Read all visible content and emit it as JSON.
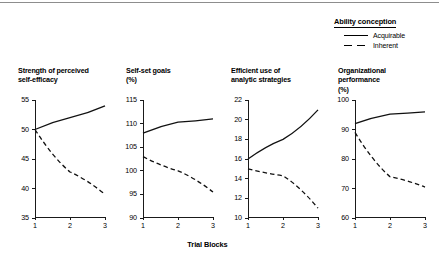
{
  "figure": {
    "xaxis_title": "Trial Blocks",
    "legend": {
      "title": "Ability conception",
      "entries": [
        {
          "label": "Acquirable",
          "style": "solid"
        },
        {
          "label": "Inherent",
          "style": "dashed"
        }
      ]
    }
  },
  "chart_data": {
    "type": "line",
    "title": "",
    "xlabel": "Trial Blocks",
    "x": [
      1,
      2,
      3
    ],
    "xtick_labels": [
      "1",
      "2",
      "3"
    ],
    "grid": false,
    "legend_position": "top-right",
    "legend_title": "Ability conception",
    "series_names": [
      "Acquirable",
      "Inherent"
    ],
    "panels": [
      {
        "title": "Strength of perceived self-efficacy",
        "title_line1": "Strength of perceived",
        "title_line2": "self-efficacy",
        "ylabel": "",
        "ylim": [
          35,
          55
        ],
        "yticks": [
          35,
          40,
          45,
          50,
          55
        ],
        "ytick_labels": [
          "35",
          "40",
          "45",
          "50",
          "55"
        ],
        "series": [
          {
            "name": "Acquirable",
            "style": "solid",
            "values": [
              50,
              52,
              54
            ]
          },
          {
            "name": "Inherent",
            "style": "dashed",
            "values": [
              50,
              42.8,
              39
            ]
          }
        ]
      },
      {
        "title": "Self-set goals (%)",
        "title_line1": "Self-set goals",
        "title_line2": "(%)",
        "ylabel": "%",
        "ylim": [
          90,
          115
        ],
        "yticks": [
          90,
          95,
          100,
          105,
          110,
          115
        ],
        "ytick_labels": [
          "90",
          "95",
          "100",
          "105",
          "110",
          "115"
        ],
        "series": [
          {
            "name": "Acquirable",
            "style": "solid",
            "values": [
              108,
              110.3,
              111
            ]
          },
          {
            "name": "Inherent",
            "style": "dashed",
            "values": [
              103,
              100,
              95.5
            ]
          }
        ]
      },
      {
        "title": "Efficient use of analytic strategies",
        "title_line1": "Efficient use of",
        "title_line2": "analytic strategies",
        "ylabel": "",
        "ylim": [
          10,
          22
        ],
        "yticks": [
          10,
          12,
          14,
          16,
          18,
          20,
          22
        ],
        "ytick_labels": [
          "10",
          "12",
          "14",
          "16",
          "18",
          "20",
          "22"
        ],
        "series": [
          {
            "name": "Acquirable",
            "style": "solid",
            "values": [
              16,
              18,
              21
            ]
          },
          {
            "name": "Inherent",
            "style": "dashed",
            "values": [
              15,
              14.3,
              11
            ]
          }
        ]
      },
      {
        "title": "Organizational performance (%)",
        "title_line1": "Organizational",
        "title_line2": "performance",
        "title_line3": "(%)",
        "ylabel": "%",
        "ylim": [
          60,
          100
        ],
        "yticks": [
          60,
          70,
          80,
          90,
          100
        ],
        "ytick_labels": [
          "60",
          "70",
          "80",
          "90",
          "100"
        ],
        "series": [
          {
            "name": "Acquirable",
            "style": "solid",
            "values": [
              92,
              95.2,
              96
            ]
          },
          {
            "name": "Inherent",
            "style": "dashed",
            "values": [
              89,
              74,
              70.5
            ]
          }
        ]
      }
    ]
  }
}
